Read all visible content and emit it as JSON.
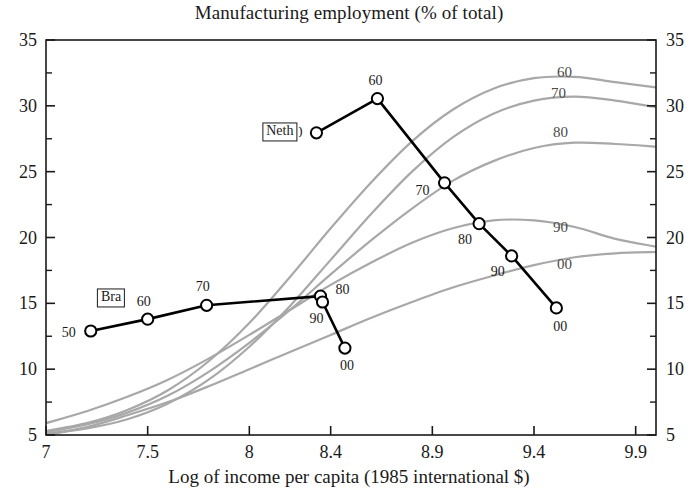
{
  "chart_data": {
    "type": "line",
    "title": "Manufacturing employment (% of total)",
    "xlabel": "Log of income per capita (1985 international $)",
    "ylabel": "",
    "xlim": [
      7.0,
      10.0
    ],
    "ylim": [
      5,
      35
    ],
    "grid": false,
    "legend_position": "inline-labels",
    "x_ticks": [
      "7",
      "7.5",
      "8",
      "8.4",
      "8.9",
      "9.4",
      "9.9"
    ],
    "x_tick_values": [
      7.0,
      7.5,
      8.0,
      8.4,
      8.9,
      9.4,
      9.9
    ],
    "y_ticks_left": [
      "5",
      "10",
      "15",
      "20",
      "25",
      "30",
      "35"
    ],
    "y_ticks_right": [
      "5",
      "10",
      "15",
      "20",
      "25",
      "30",
      "35"
    ],
    "y_tick_values": [
      5,
      10,
      15,
      20,
      25,
      30,
      35
    ],
    "y_minor_ticks": [
      7.5,
      12.5,
      17.5,
      22.5,
      27.5,
      32.5
    ],
    "series": [
      {
        "name": "Bra",
        "tag_label": "Bra",
        "color": "#000000",
        "tag_x": 7.32,
        "tag_y": 15.4,
        "points": [
          {
            "label": "50",
            "x": 7.22,
            "y": 12.9,
            "label_dx": -22,
            "label_dy": 2
          },
          {
            "label": "60",
            "x": 7.5,
            "y": 13.8,
            "label_dx": -4,
            "label_dy": -17
          },
          {
            "label": "70",
            "x": 7.79,
            "y": 14.85,
            "label_dx": -4,
            "label_dy": -18
          },
          {
            "label": "80",
            "x": 8.35,
            "y": 15.55,
            "label_dx": 22,
            "label_dy": -6
          },
          {
            "label": "90",
            "x": 8.36,
            "y": 15.1,
            "label_dx": -6,
            "label_dy": 17
          },
          {
            "label": "00",
            "x": 8.47,
            "y": 11.6,
            "label_dx": 2,
            "label_dy": 18
          }
        ]
      },
      {
        "name": "Neth",
        "tag_label": "Neth",
        "color": "#000000",
        "tag_x": 8.15,
        "tag_y": 28.0,
        "points": [
          {
            "label": "50",
            "x": 8.33,
            "y": 27.95,
            "label_dx": -21,
            "label_dy": 0
          },
          {
            "label": "60",
            "x": 8.63,
            "y": 30.55,
            "label_dx": -2,
            "label_dy": -18
          },
          {
            "label": "70",
            "x": 8.96,
            "y": 24.15,
            "label_dx": -22,
            "label_dy": 8
          },
          {
            "label": "80",
            "x": 9.13,
            "y": 21.05,
            "label_dx": -14,
            "label_dy": 16
          },
          {
            "label": "90",
            "x": 9.29,
            "y": 18.6,
            "label_dx": -14,
            "label_dy": 16
          },
          {
            "label": "00",
            "x": 9.51,
            "y": 14.65,
            "label_dx": 4,
            "label_dy": 19
          }
        ]
      }
    ],
    "reference_curves": [
      {
        "label": "60",
        "color": "#a8a8a8",
        "label_x": 9.55,
        "label_y": 32.6,
        "points": [
          {
            "x": 7.0,
            "y": 5.3
          },
          {
            "x": 7.2,
            "y": 5.9
          },
          {
            "x": 7.4,
            "y": 6.9
          },
          {
            "x": 7.6,
            "y": 8.4
          },
          {
            "x": 7.8,
            "y": 10.6
          },
          {
            "x": 8.0,
            "y": 13.5
          },
          {
            "x": 8.2,
            "y": 17.0
          },
          {
            "x": 8.4,
            "y": 20.7
          },
          {
            "x": 8.6,
            "y": 24.2
          },
          {
            "x": 8.8,
            "y": 27.3
          },
          {
            "x": 9.0,
            "y": 29.7
          },
          {
            "x": 9.2,
            "y": 31.3
          },
          {
            "x": 9.4,
            "y": 32.1
          },
          {
            "x": 9.6,
            "y": 32.2
          },
          {
            "x": 9.8,
            "y": 31.8
          },
          {
            "x": 10.0,
            "y": 31.4
          }
        ]
      },
      {
        "label": "70",
        "color": "#a8a8a8",
        "label_x": 9.52,
        "label_y": 31.0,
        "points": [
          {
            "x": 7.0,
            "y": 5.1
          },
          {
            "x": 7.2,
            "y": 5.5
          },
          {
            "x": 7.4,
            "y": 6.2
          },
          {
            "x": 7.6,
            "y": 7.4
          },
          {
            "x": 7.8,
            "y": 9.2
          },
          {
            "x": 8.0,
            "y": 11.7
          },
          {
            "x": 8.2,
            "y": 14.8
          },
          {
            "x": 8.4,
            "y": 18.3
          },
          {
            "x": 8.6,
            "y": 21.8
          },
          {
            "x": 8.8,
            "y": 25.0
          },
          {
            "x": 9.0,
            "y": 27.6
          },
          {
            "x": 9.2,
            "y": 29.4
          },
          {
            "x": 9.4,
            "y": 30.4
          },
          {
            "x": 9.6,
            "y": 30.7
          },
          {
            "x": 9.8,
            "y": 30.4
          },
          {
            "x": 10.0,
            "y": 29.9
          }
        ]
      },
      {
        "label": "80",
        "color": "#a8a8a8",
        "label_x": 9.53,
        "label_y": 28.0,
        "points": [
          {
            "x": 7.0,
            "y": 5.2
          },
          {
            "x": 7.2,
            "y": 5.8
          },
          {
            "x": 7.4,
            "y": 6.7
          },
          {
            "x": 7.6,
            "y": 8.0
          },
          {
            "x": 7.8,
            "y": 9.8
          },
          {
            "x": 8.0,
            "y": 12.0
          },
          {
            "x": 8.2,
            "y": 14.5
          },
          {
            "x": 8.4,
            "y": 17.2
          },
          {
            "x": 8.6,
            "y": 19.8
          },
          {
            "x": 8.8,
            "y": 22.2
          },
          {
            "x": 9.0,
            "y": 24.3
          },
          {
            "x": 9.2,
            "y": 25.8
          },
          {
            "x": 9.4,
            "y": 26.8
          },
          {
            "x": 9.6,
            "y": 27.2
          },
          {
            "x": 9.8,
            "y": 27.1
          },
          {
            "x": 10.0,
            "y": 26.9
          }
        ]
      },
      {
        "label": "90",
        "color": "#a8a8a8",
        "label_x": 9.53,
        "label_y": 20.8,
        "points": [
          {
            "x": 7.0,
            "y": 5.9
          },
          {
            "x": 7.2,
            "y": 6.8
          },
          {
            "x": 7.4,
            "y": 7.9
          },
          {
            "x": 7.6,
            "y": 9.2
          },
          {
            "x": 7.8,
            "y": 10.8
          },
          {
            "x": 8.0,
            "y": 12.6
          },
          {
            "x": 8.2,
            "y": 14.5
          },
          {
            "x": 8.4,
            "y": 16.4
          },
          {
            "x": 8.6,
            "y": 18.1
          },
          {
            "x": 8.8,
            "y": 19.6
          },
          {
            "x": 9.0,
            "y": 20.7
          },
          {
            "x": 9.2,
            "y": 21.3
          },
          {
            "x": 9.4,
            "y": 21.3
          },
          {
            "x": 9.6,
            "y": 20.8
          },
          {
            "x": 9.8,
            "y": 19.9
          },
          {
            "x": 10.0,
            "y": 19.3
          }
        ]
      },
      {
        "label": "00",
        "color": "#a8a8a8",
        "label_x": 9.55,
        "label_y": 18.0,
        "points": [
          {
            "x": 7.0,
            "y": 5.0
          },
          {
            "x": 7.2,
            "y": 5.6
          },
          {
            "x": 7.4,
            "y": 6.5
          },
          {
            "x": 7.6,
            "y": 7.5
          },
          {
            "x": 7.8,
            "y": 8.7
          },
          {
            "x": 8.0,
            "y": 10.0
          },
          {
            "x": 8.2,
            "y": 11.3
          },
          {
            "x": 8.4,
            "y": 12.6
          },
          {
            "x": 8.6,
            "y": 13.9
          },
          {
            "x": 8.8,
            "y": 15.1
          },
          {
            "x": 9.0,
            "y": 16.2
          },
          {
            "x": 9.2,
            "y": 17.1
          },
          {
            "x": 9.4,
            "y": 17.9
          },
          {
            "x": 9.6,
            "y": 18.5
          },
          {
            "x": 9.8,
            "y": 18.8
          },
          {
            "x": 10.0,
            "y": 18.9
          }
        ]
      }
    ],
    "axis_color": "#1a1a1a",
    "marker_face_color": "#ffffff",
    "marker_edge_color": "#000000"
  }
}
